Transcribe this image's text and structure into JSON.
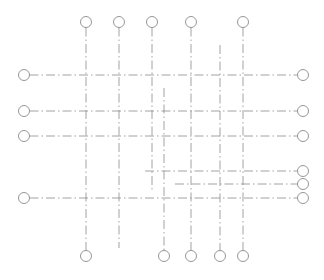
{
  "diagram": {
    "type": "structural-grid-lines",
    "colors": {
      "line": "#8a8a8a",
      "background": "#ffffff"
    },
    "bubble_radius": 5.5,
    "vertical_gridlines": [
      {
        "id": "v1",
        "x": 86,
        "y1": 22,
        "y2": 256,
        "bubble_top": true,
        "bubble_bottom": true
      },
      {
        "id": "v2",
        "x": 119,
        "y1": 22,
        "y2": 248,
        "bubble_top": true,
        "bubble_bottom": false
      },
      {
        "id": "v3",
        "x": 152,
        "y1": 22,
        "y2": 192,
        "bubble_top": true,
        "bubble_bottom": false
      },
      {
        "id": "v4",
        "x": 164,
        "y1": 88,
        "y2": 256,
        "bubble_top": false,
        "bubble_bottom": true
      },
      {
        "id": "v5",
        "x": 191,
        "y1": 22,
        "y2": 256,
        "bubble_top": true,
        "bubble_bottom": true
      },
      {
        "id": "v6",
        "x": 220,
        "y1": 45,
        "y2": 256,
        "bubble_top": false,
        "bubble_bottom": true
      },
      {
        "id": "v7",
        "x": 243,
        "y1": 22,
        "y2": 256,
        "bubble_top": true,
        "bubble_bottom": true
      }
    ],
    "horizontal_gridlines": [
      {
        "id": "h1",
        "y": 75,
        "x1": 24,
        "x2": 303,
        "bubble_left": true,
        "bubble_right": true
      },
      {
        "id": "h2",
        "y": 111,
        "x1": 24,
        "x2": 303,
        "bubble_left": true,
        "bubble_right": true
      },
      {
        "id": "h3",
        "y": 136,
        "x1": 24,
        "x2": 303,
        "bubble_left": true,
        "bubble_right": true
      },
      {
        "id": "h4",
        "y": 171,
        "x1": 145,
        "x2": 303,
        "bubble_left": false,
        "bubble_right": true
      },
      {
        "id": "h5",
        "y": 184,
        "x1": 175,
        "x2": 303,
        "bubble_left": false,
        "bubble_right": true
      },
      {
        "id": "h6",
        "y": 198,
        "x1": 24,
        "x2": 303,
        "bubble_left": true,
        "bubble_right": true
      }
    ]
  }
}
